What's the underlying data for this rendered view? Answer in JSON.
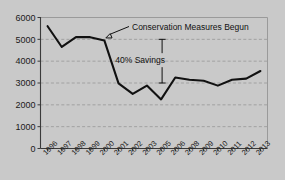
{
  "chart_data": {
    "type": "line",
    "title": "",
    "subtitle": "",
    "xlabel": "",
    "ylabel": "",
    "ylim": [
      0,
      6000
    ],
    "ytick_step": 1000,
    "ytick_labels": [
      "0",
      "1000",
      "2000",
      "3000",
      "4000",
      "5000",
      "6000"
    ],
    "grid": true,
    "legend": "none",
    "categories": [
      "1996",
      "1997",
      "1998",
      "1999",
      "2000",
      "2001",
      "2002",
      "2003",
      "2005",
      "2006",
      "2008",
      "2009",
      "2010",
      "2011",
      "2012",
      "2013"
    ],
    "values": [
      5600,
      4650,
      5100,
      5100,
      4950,
      2980,
      2500,
      2880,
      2250,
      3250,
      3150,
      3100,
      2880,
      3150,
      3200,
      3550
    ],
    "series": [
      {
        "name": "water-use",
        "values": [
          5600,
          4650,
          5100,
          5100,
          4950,
          2980,
          2500,
          2880,
          2250,
          3250,
          3150,
          3100,
          2880,
          3150,
          3200,
          3550
        ]
      }
    ],
    "annotations": [
      {
        "id": "conservation-note",
        "text": "Conservation Measures Begun",
        "points_to_category": "2000",
        "points_to_value": 4950,
        "has_arrow": true
      },
      {
        "id": "savings-note",
        "text": "40% Savings",
        "span_from_value": 5000,
        "span_to_value": 3000,
        "has_range_bar": true
      }
    ],
    "colors": {
      "background": "#c9c9c9",
      "line": "#111111",
      "grid": "#8f8f8f",
      "axis": "#3a3a3a",
      "text": "#1a1a1a"
    }
  }
}
